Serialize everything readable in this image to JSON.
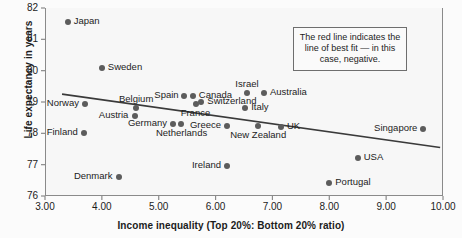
{
  "chart_data": {
    "type": "scatter",
    "title": "",
    "xlabel": "Income inequality (Top 20%: Bottom 20% ratio)",
    "ylabel": "Life expectancy in years",
    "xlim": [
      3.0,
      10.0
    ],
    "ylim": [
      76,
      82
    ],
    "xticks": [
      "3.00",
      "4.00",
      "5.00",
      "6.00",
      "7.00",
      "8.00",
      "9.00",
      "10.00"
    ],
    "yticks": [
      "76",
      "77",
      "78",
      "79",
      "80",
      "81",
      "82"
    ],
    "grid": false,
    "legend": "none",
    "marker_color": "#5c5c5c",
    "trendline_color": "#3a3a3a",
    "points": [
      {
        "label": "Japan",
        "x": 3.4,
        "y": 81.55,
        "label_side": "right"
      },
      {
        "label": "Sweden",
        "x": 4.0,
        "y": 80.1,
        "label_side": "right"
      },
      {
        "label": "Norway",
        "x": 3.7,
        "y": 78.95,
        "label_side": "left"
      },
      {
        "label": "Finland",
        "x": 3.68,
        "y": 78.0,
        "label_side": "left"
      },
      {
        "label": "Denmark",
        "x": 4.3,
        "y": 76.6,
        "label_side": "left"
      },
      {
        "label": "Austria",
        "x": 4.58,
        "y": 78.55,
        "label_side": "left"
      },
      {
        "label": "Belgium",
        "x": 4.6,
        "y": 78.8,
        "label_side": "above"
      },
      {
        "label": "Germany",
        "x": 5.25,
        "y": 78.3,
        "label_side": "left"
      },
      {
        "label": "Netherlands",
        "x": 5.4,
        "y": 78.3,
        "label_side": "below"
      },
      {
        "label": "Spain",
        "x": 5.45,
        "y": 79.2,
        "label_side": "left"
      },
      {
        "label": "Canada",
        "x": 5.6,
        "y": 79.2,
        "label_side": "right"
      },
      {
        "label": "Switzerland",
        "x": 5.75,
        "y": 79.0,
        "label_side": "right"
      },
      {
        "label": "France",
        "x": 5.65,
        "y": 78.95,
        "label_side": "below"
      },
      {
        "label": "Greece",
        "x": 6.2,
        "y": 78.25,
        "label_side": "left"
      },
      {
        "label": "Ireland",
        "x": 6.2,
        "y": 76.95,
        "label_side": "left"
      },
      {
        "label": "Israel",
        "x": 6.55,
        "y": 79.3,
        "label_side": "above"
      },
      {
        "label": "Italy",
        "x": 6.52,
        "y": 78.8,
        "label_side": "right"
      },
      {
        "label": "Australia",
        "x": 6.85,
        "y": 79.3,
        "label_side": "right"
      },
      {
        "label": "New Zealand",
        "x": 6.75,
        "y": 78.25,
        "label_side": "below"
      },
      {
        "label": "UK",
        "x": 7.15,
        "y": 78.2,
        "label_side": "right"
      },
      {
        "label": "Portugal",
        "x": 8.0,
        "y": 76.4,
        "label_side": "right"
      },
      {
        "label": "USA",
        "x": 8.5,
        "y": 77.2,
        "label_side": "right"
      },
      {
        "label": "Singapore",
        "x": 9.65,
        "y": 78.15,
        "label_side": "left"
      }
    ],
    "trendline": {
      "x0": 3.3,
      "y0": 79.25,
      "x1": 9.95,
      "y1": 77.55
    }
  },
  "annotation": {
    "text": "The red line indicates the line of best fit — in this case, negative."
  }
}
